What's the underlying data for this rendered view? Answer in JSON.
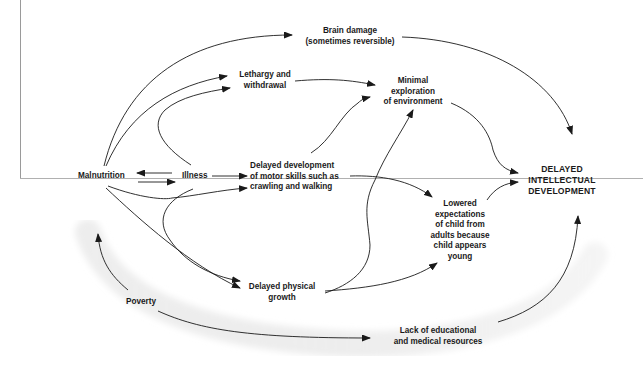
{
  "diagram": {
    "title": "",
    "nodes": {
      "brain_damage": "Brain damage\n(sometimes reversible)",
      "lethargy": "Lethargy and\nwithdrawal",
      "minimal_exploration": "Minimal\nexploration\nof environment",
      "malnutrition": "Malnutrition",
      "illness": "Illness",
      "delayed_motor": "Delayed development\nof motor skills such as\ncrawling and walking",
      "lowered_expectations": "Lowered\nexpectations\nof child from\nadults because\nchild appears\nyoung",
      "delayed_intellectual": "DELAYED\nINTELLECTUAL\nDEVELOPMENT",
      "delayed_physical": "Delayed physical\ngrowth",
      "poverty": "Poverty",
      "lack_resources": "Lack of educational\nand medical resources"
    },
    "edges": [
      {
        "from": "Malnutrition",
        "to": "Brain damage (sometimes reversible)"
      },
      {
        "from": "Malnutrition",
        "to": "Lethargy and withdrawal"
      },
      {
        "from": "Illness",
        "to": "Lethargy and withdrawal"
      },
      {
        "from": "Illness",
        "to": "Malnutrition"
      },
      {
        "from": "Malnutrition",
        "to": "Illness"
      },
      {
        "from": "Illness",
        "to": "Delayed development of motor skills such as crawling and walking"
      },
      {
        "from": "Malnutrition",
        "to": "Delayed development of motor skills such as crawling and walking"
      },
      {
        "from": "Malnutrition",
        "to": "Delayed physical growth"
      },
      {
        "from": "Illness",
        "to": "Delayed physical growth"
      },
      {
        "from": "Lethargy and withdrawal",
        "to": "Minimal exploration of environment"
      },
      {
        "from": "Delayed development of motor skills such as crawling and walking",
        "to": "Minimal exploration of environment"
      },
      {
        "from": "Delayed physical growth",
        "to": "Minimal exploration of environment"
      },
      {
        "from": "Delayed development of motor skills such as crawling and walking",
        "to": "Lowered expectations of child from adults because child appears young"
      },
      {
        "from": "Delayed physical growth",
        "to": "Lowered expectations of child from adults because child appears young"
      },
      {
        "from": "Brain damage (sometimes reversible)",
        "to": "DELAYED INTELLECTUAL DEVELOPMENT"
      },
      {
        "from": "Minimal exploration of environment",
        "to": "DELAYED INTELLECTUAL DEVELOPMENT"
      },
      {
        "from": "Lowered expectations of child from adults because child appears young",
        "to": "DELAYED INTELLECTUAL DEVELOPMENT"
      },
      {
        "from": "Poverty",
        "to": "Malnutrition"
      },
      {
        "from": "Poverty",
        "to": "Lack of educational and medical resources"
      },
      {
        "from": "Lack of educational and medical resources",
        "to": "DELAYED INTELLECTUAL DEVELOPMENT"
      }
    ],
    "colors": {
      "line": "#1a1a1a",
      "text": "#1a1a1a",
      "shaded_arc": "#ececec",
      "frame": "#9a9a9a"
    }
  }
}
